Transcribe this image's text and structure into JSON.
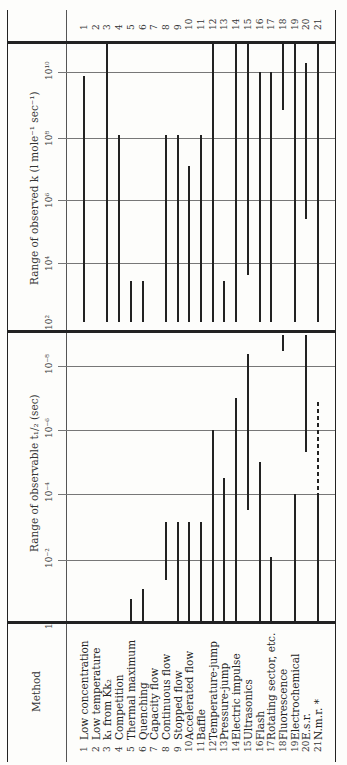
{
  "table": {
    "method_header": "Method",
    "t_half_header": "Range of observable t₁/₂ (sec)",
    "k_header": "Range of observed k (l mole⁻¹ sec⁻¹)",
    "t_half_ticks": [
      "1",
      "10⁻²",
      "10⁻⁴",
      "10⁻⁶",
      "10⁻⁸"
    ],
    "k_ticks": [
      "10²",
      "10⁴",
      "10⁶",
      "10⁸",
      "10¹⁰"
    ],
    "rows": [
      {
        "num": "1",
        "method": "Low concentration"
      },
      {
        "num": "2",
        "method": "Low temperature"
      },
      {
        "num": "3",
        "method": "k₁ from Kk₂"
      },
      {
        "num": "4",
        "method": "Competition"
      },
      {
        "num": "5",
        "method": "Thermal maximum"
      },
      {
        "num": "6",
        "method": "Quenching"
      },
      {
        "num": "7",
        "method": "Capacity flow"
      },
      {
        "num": "8",
        "method": "Continuous flow"
      },
      {
        "num": "9",
        "method": "Stopped flow"
      },
      {
        "num": "10",
        "method": "Accelerated flow"
      },
      {
        "num": "11",
        "method": "Baffle"
      },
      {
        "num": "12",
        "method": "Temperature-jump"
      },
      {
        "num": "13",
        "method": "Pressure-jump"
      },
      {
        "num": "14",
        "method": "Electric impulse"
      },
      {
        "num": "15",
        "method": "Ultrasonics"
      },
      {
        "num": "16",
        "method": "Flash"
      },
      {
        "num": "17",
        "method": "Rotating sector, etc."
      },
      {
        "num": "18",
        "method": "Fluorescence"
      },
      {
        "num": "19",
        "method": "Electrochemical"
      },
      {
        "num": "20",
        "method": "E.s.r."
      },
      {
        "num": "21",
        "method": "N.m.r. *"
      }
    ]
  },
  "chart_data": [
    {
      "type": "bar",
      "title": "Range of observable t1/2 (sec)",
      "scale": "log10",
      "axis_range_log10": [
        0,
        -9
      ],
      "ticks": [
        "1",
        "1e-2",
        "1e-4",
        "1e-6",
        "1e-8"
      ],
      "categories": [
        "Low concentration",
        "Low temperature",
        "k1 from Kk2",
        "Competition",
        "Thermal maximum",
        "Quenching",
        "Capacity flow",
        "Continuous flow",
        "Stopped flow",
        "Accelerated flow",
        "Baffle",
        "Temperature-jump",
        "Pressure-jump",
        "Electric impulse",
        "Ultrasonics",
        "Flash",
        "Rotating sector, etc.",
        "Fluorescence",
        "Electrochemical",
        "E.s.r.",
        "N.m.r."
      ],
      "ranges_log10": [
        null,
        null,
        null,
        null,
        [
          0,
          -0.7
        ],
        [
          0,
          -1.0
        ],
        null,
        [
          -1.3,
          -3.1
        ],
        [
          0,
          -3.1
        ],
        [
          0,
          -3.1
        ],
        [
          0,
          -3.1
        ],
        [
          0,
          -6.0
        ],
        [
          0,
          -4.5
        ],
        [
          0,
          -7.0
        ],
        [
          -3.5,
          -8.4
        ],
        [
          0,
          -5.0
        ],
        [
          0,
          -2.0
        ],
        [
          -8.5,
          -9.0
        ],
        [
          0,
          -4.0
        ],
        [
          -5.3,
          -9.0
        ],
        [
          0,
          -4.0
        ]
      ],
      "dashed_extension_log10": {
        "N.m.r.": [
          -4.0,
          -6.9
        ]
      }
    },
    {
      "type": "bar",
      "title": "Range of observed k (l mole-1 sec-1)",
      "scale": "log10",
      "axis_range_log10": [
        2,
        11
      ],
      "ticks": [
        "1e2",
        "1e4",
        "1e6",
        "1e8",
        "1e10"
      ],
      "categories": [
        "Low concentration",
        "Low temperature",
        "k1 from Kk2",
        "Competition",
        "Thermal maximum",
        "Quenching",
        "Capacity flow",
        "Continuous flow",
        "Stopped flow",
        "Accelerated flow",
        "Baffle",
        "Temperature-jump",
        "Pressure-jump",
        "Electric impulse",
        "Ultrasonics",
        "Flash",
        "Rotating sector, etc.",
        "Fluorescence",
        "Electrochemical",
        "E.s.r.",
        "N.m.r."
      ],
      "ranges_log10": [
        [
          2,
          9.9
        ],
        null,
        [
          2,
          11
        ],
        [
          2,
          8
        ],
        [
          2,
          3.3
        ],
        [
          2,
          3.3
        ],
        null,
        [
          2,
          8
        ],
        [
          2,
          8
        ],
        [
          2,
          7
        ],
        [
          2,
          8
        ],
        [
          2,
          11
        ],
        [
          2,
          3.3
        ],
        [
          2,
          11
        ],
        [
          3.5,
          11
        ],
        [
          2,
          10
        ],
        [
          2,
          10
        ],
        [
          8.8,
          11
        ],
        [
          2,
          11
        ],
        [
          5.3,
          10.3
        ],
        [
          2,
          11
        ]
      ]
    }
  ]
}
